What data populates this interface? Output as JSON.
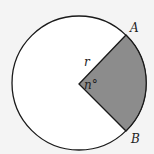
{
  "diagram": {
    "labels": {
      "point_a": "A",
      "point_b": "B",
      "radius": "r",
      "angle": "n°"
    },
    "colors": {
      "background": "#f4f4f4",
      "circle_fill": "#ffffff",
      "sector_fill": "#8c8c8c",
      "stroke": "#1a1a1a"
    }
  }
}
